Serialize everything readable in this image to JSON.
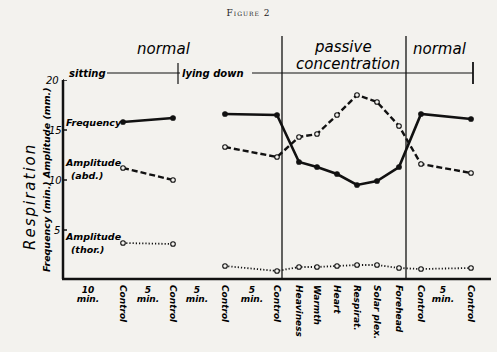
{
  "figure_title": "Figure 2",
  "chart_data": {
    "type": "line",
    "title": "Figure 2",
    "ylabel": "Respiration",
    "ylabel_secondary": "Frequency (min.)  Amplitude (mm.)",
    "ylim": [
      0,
      20
    ],
    "yticks": [
      5,
      10,
      15,
      20
    ],
    "phases": [
      {
        "label": "normal",
        "sublabels": [
          "sitting",
          "lying down"
        ]
      },
      {
        "label": "passive concentration"
      },
      {
        "label": "normal"
      }
    ],
    "x_labels": [
      "10 min.",
      "Control",
      "5 min.",
      "Control",
      "5 min.",
      "Control",
      "5 min.",
      "Control",
      "Heaviness",
      "Warmth",
      "Heart",
      "Respirat.",
      "Solar plex.",
      "Forehead",
      "Control",
      "5 min.",
      "Control"
    ],
    "x": [
      "Control",
      "Control",
      "Control",
      "Control",
      "Heaviness",
      "Warmth",
      "Heart",
      "Respirat.",
      "Solar plex.",
      "Forehead",
      "Control",
      "Control"
    ],
    "series": [
      {
        "name": "Frequency",
        "style": "solid",
        "values": [
          15.8,
          16.2,
          16.6,
          16.5,
          11.8,
          11.3,
          10.6,
          9.5,
          9.9,
          11.3,
          16.6,
          16.1
        ]
      },
      {
        "name": "Amplitude (abd.)",
        "style": "dashed",
        "values": [
          11.2,
          10.0,
          13.3,
          12.3,
          14.3,
          14.6,
          16.5,
          18.5,
          17.8,
          15.4,
          11.6,
          10.7
        ]
      },
      {
        "name": "Amplitude (thor.)",
        "style": "dotted",
        "values": [
          3.7,
          3.6,
          1.4,
          0.9,
          1.3,
          1.3,
          1.4,
          1.5,
          1.5,
          1.2,
          1.1,
          1.2
        ]
      }
    ],
    "grid": false,
    "legend_position": "inline-left"
  },
  "labels": {
    "phase1": "normal",
    "phase2a": "passive",
    "phase2b": "concentration",
    "phase3": "normal",
    "sitting": "sitting",
    "lying": "lying down",
    "freq": "Frequency",
    "abd1": "Amplitude",
    "abd2": "(abd.)",
    "thor1": "Amplitude",
    "thor2": "(thor.)",
    "ylabel": "Respiration",
    "ylabel2": "Frequency (min.) Amplitude (mm.)",
    "y20": "20",
    "y15": "15",
    "y10": "10",
    "y5": "5"
  }
}
